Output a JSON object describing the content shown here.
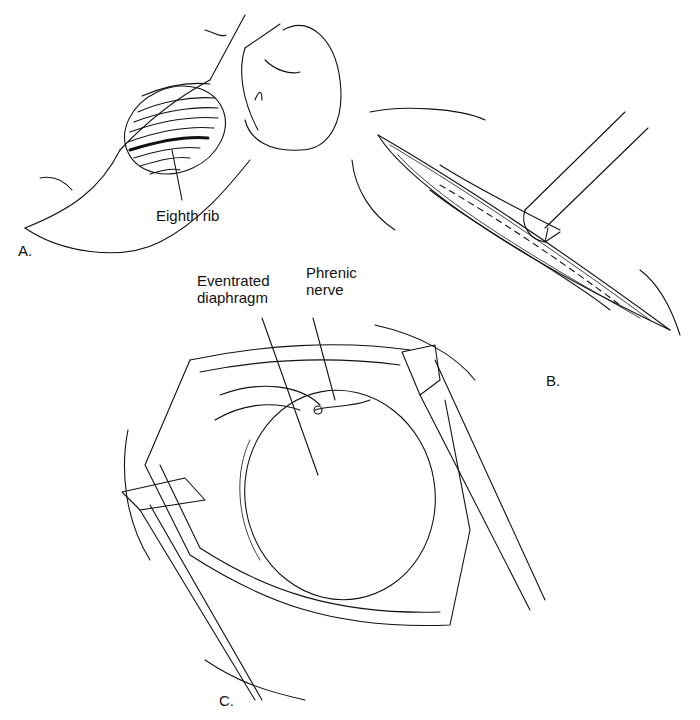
{
  "figure": {
    "panels": [
      {
        "id": "A",
        "letter": "A.",
        "description": "infant lateral position with rib cage outline"
      },
      {
        "id": "B",
        "letter": "B.",
        "description": "intercostal incision with retractor"
      },
      {
        "id": "C",
        "letter": "C.",
        "description": "opened chest showing eventrated diaphragm"
      }
    ],
    "labels": {
      "eighth_rib": "Eighth rib",
      "eventrated_line1": "Eventrated",
      "eventrated_line2": "diaphragm",
      "phrenic_line1": "Phrenic",
      "phrenic_line2": "nerve"
    },
    "colors": {
      "ink": "#111111",
      "background": "#ffffff"
    }
  }
}
